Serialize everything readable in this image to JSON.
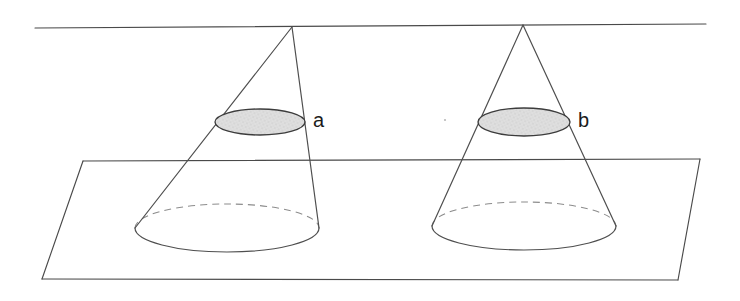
{
  "figure": {
    "background_color": "#ffffff",
    "line_color": "#4a4a4a",
    "hidden_line_color": "#8c8c8c",
    "shading_color": "#dcdcdc",
    "shading_edge_color": "#3c3c3c",
    "label_color": "#1b1b1b"
  },
  "labels": {
    "left_section": "a",
    "right_section": "b"
  },
  "geometry": {
    "top_plane_line": {
      "x1": 35,
      "y1": 28,
      "x2": 706,
      "y2": 24
    },
    "bottom_plane": {
      "back_left": {
        "x": 83,
        "y": 161
      },
      "back_right": {
        "x": 700,
        "y": 159
      },
      "front_right": {
        "x": 678,
        "y": 280
      },
      "front_left": {
        "x": 42,
        "y": 279
      }
    },
    "left_cone": {
      "apex": {
        "x": 292,
        "y": 27
      },
      "base_center": {
        "x": 227,
        "y": 228
      },
      "base_rx": 92,
      "base_ry": 24,
      "section_center": {
        "x": 260,
        "y": 122
      },
      "section_rx": 45,
      "section_ry": 13,
      "section_label": "a",
      "label_position": {
        "x": 313,
        "y": 122
      }
    },
    "right_cone": {
      "apex": {
        "x": 523,
        "y": 25
      },
      "base_center": {
        "x": 524,
        "y": 226
      },
      "base_rx": 92,
      "base_ry": 24,
      "section_center": {
        "x": 524,
        "y": 122
      },
      "section_rx": 46,
      "section_ry": 14,
      "section_label": "b",
      "label_position": {
        "x": 578,
        "y": 122
      }
    }
  }
}
